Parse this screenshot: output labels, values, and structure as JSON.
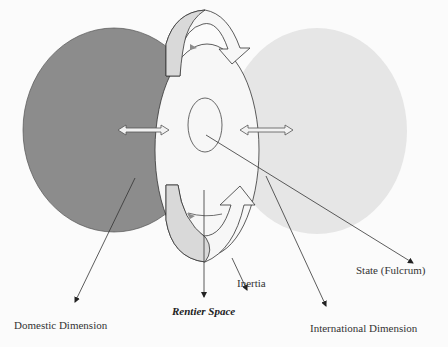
{
  "diagram": {
    "type": "overlapping-ellipses-concept",
    "colors": {
      "background": "#fbfbfb",
      "domestic_fill": "#8c8c8c",
      "international_fill": "#e6e6e6",
      "rentier_fill": "#f7f7f7",
      "arrow_band_fill": "#d9d9d9",
      "stroke": "#444444"
    },
    "nodes": [
      {
        "id": "domestic",
        "label": "Domestic Dimension"
      },
      {
        "id": "international",
        "label": "International Dimension"
      },
      {
        "id": "rentier",
        "label": "Rentier Space"
      },
      {
        "id": "state",
        "label": "State (Fulcrum)"
      },
      {
        "id": "inertia",
        "label": "Inertia"
      }
    ],
    "edges": [
      {
        "from": "domestic",
        "to": "rentier",
        "type": "double-arrow"
      },
      {
        "from": "rentier",
        "to": "international",
        "type": "double-arrow"
      },
      {
        "from": "rentier",
        "to": "rentier",
        "type": "circular-arrows",
        "label": "Inertia"
      }
    ]
  },
  "labels": {
    "domestic": "Domestic Dimension",
    "rentier": "Rentier Space",
    "inertia": "Inertia",
    "state": "State (Fulcrum)",
    "international": "International Dimension"
  }
}
